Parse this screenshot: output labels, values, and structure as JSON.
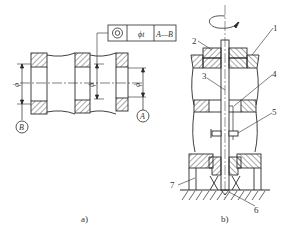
{
  "figure_a": {
    "caption": "a)",
    "tolerance_frame": {
      "symbol": "concentricity-icon",
      "value": "ϕt",
      "datum": "A—B"
    },
    "datum_labels": [
      "B",
      "A"
    ],
    "diameter_labels": [
      "ϕ",
      "ϕ",
      "ϕ"
    ]
  },
  "figure_b": {
    "caption": "b)",
    "part_numbers": [
      "1",
      "2",
      "3",
      "4",
      "5",
      "6",
      "7"
    ]
  },
  "colors": {
    "line": "#2a2a2a",
    "background": "#ffffff"
  }
}
